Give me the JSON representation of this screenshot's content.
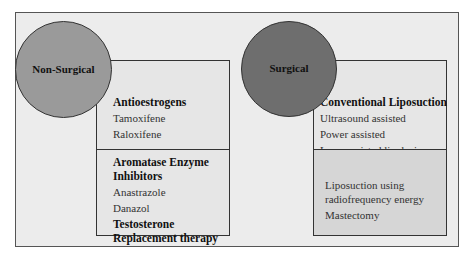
{
  "diagram": {
    "type": "treatment classification",
    "groups": [
      {
        "label": "Non-Surgical",
        "circle_color": "#9a9a9a",
        "sections": [
          {
            "items": [
              {
                "text": "Antioestrogens",
                "bold": true
              },
              {
                "text": "Tamoxifene",
                "bold": false
              },
              {
                "text": "Raloxifene",
                "bold": false
              }
            ]
          },
          {
            "items": [
              {
                "text": "Aromatase Enzyme Inhibitors",
                "bold": true
              },
              {
                "text": "Anastrazole",
                "bold": false
              },
              {
                "text": "Danazol",
                "bold": false
              },
              {
                "text": "Testosterone Replacement therapy",
                "bold": true
              }
            ]
          }
        ]
      },
      {
        "label": "Surgical",
        "circle_color": "#6e6e6e",
        "sections": [
          {
            "items": [
              {
                "text": "Conventional Liposuction",
                "bold": true
              },
              {
                "text": "Ultrasound assisted",
                "bold": false
              },
              {
                "text": "Power assisted",
                "bold": false
              },
              {
                "text": "Laser assisted lipolysis",
                "bold": false
              }
            ]
          },
          {
            "items": [
              {
                "text": "Liposuction using radiofrequency energy",
                "bold": false
              },
              {
                "text": "Mastectomy",
                "bold": false
              }
            ]
          }
        ]
      }
    ]
  }
}
